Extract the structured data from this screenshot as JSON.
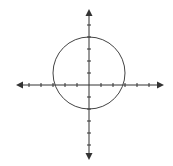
{
  "figure": {
    "width": 173,
    "height": 166,
    "origin_px": [
      89,
      85
    ],
    "unit_px": 12,
    "axis_color": "#333333",
    "circle_color": "#444444",
    "x_axis": {
      "min_tick": -5,
      "max_tick": 5,
      "left_px": 16,
      "right_px": 164,
      "arrows": true
    },
    "y_axis": {
      "min_tick": -5,
      "max_tick": 5,
      "top_px": 9,
      "bottom_px": 160,
      "arrows": true
    },
    "circle": {
      "center": [
        0,
        1
      ],
      "radius": 3
    },
    "labels": []
  }
}
